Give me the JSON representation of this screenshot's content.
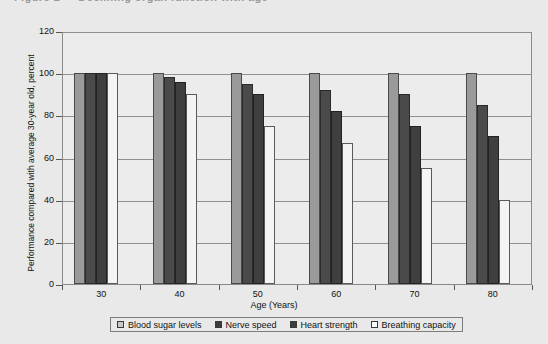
{
  "title": {
    "text": "Figure 1 — Declining organ function with age",
    "visible": "clipped"
  },
  "chart_data": {
    "type": "bar",
    "title": "",
    "xlabel": "Age (Years)",
    "ylabel": "Performance compared with average 30-year old, percent",
    "categories": [
      "30",
      "40",
      "50",
      "60",
      "70",
      "80"
    ],
    "ylim": [
      0,
      120
    ],
    "ytick_labels": [
      "0",
      "20",
      "40",
      "60",
      "80",
      "100",
      "120"
    ],
    "ytick_values": [
      0,
      20,
      40,
      60,
      80,
      100,
      120
    ],
    "grid": true,
    "legend_position": "bottom",
    "series": [
      {
        "name": "Blood sugar levels",
        "color": "#9a9a9a",
        "values": [
          100,
          100,
          100,
          100,
          100,
          100
        ]
      },
      {
        "name": "Nerve speed",
        "color": "#4a4a4a",
        "values": [
          100,
          98,
          95,
          92,
          90,
          85
        ]
      },
      {
        "name": "Heart strength",
        "color": "#3f3f3f",
        "values": [
          100,
          96,
          90,
          82,
          75,
          70
        ]
      },
      {
        "name": "Breathing capacity",
        "color": "#f4f4f4",
        "values": [
          100,
          90,
          75,
          67,
          55,
          40
        ]
      }
    ]
  }
}
